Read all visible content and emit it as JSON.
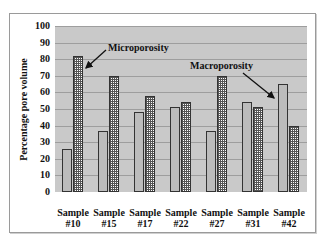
{
  "chart_data": {
    "type": "bar",
    "title": "",
    "xlabel": "",
    "ylabel": "Percentage pore volume",
    "ylim": [
      0,
      100
    ],
    "yticks": [
      0,
      10,
      20,
      30,
      40,
      50,
      60,
      70,
      80,
      90,
      100
    ],
    "grid": true,
    "legend": "none (inline annotations)",
    "categories": [
      "Sample #10",
      "Sample #15",
      "Sample #17",
      "Sample #22",
      "Sample #27",
      "Sample #31",
      "Sample #42"
    ],
    "category_lines": [
      [
        "Sample",
        "#10"
      ],
      [
        "Sample",
        "#15"
      ],
      [
        "Sample",
        "#17"
      ],
      [
        "Sample",
        "#22"
      ],
      [
        "Sample",
        "#27"
      ],
      [
        "Sample",
        "#31"
      ],
      [
        "Sample",
        "#42"
      ]
    ],
    "series": [
      {
        "name": "Macroporosity",
        "pattern": "dotted-light",
        "values": [
          26,
          37,
          48,
          51,
          37,
          54,
          65
        ]
      },
      {
        "name": "Microporosity",
        "pattern": "grid-checkered",
        "values": [
          82,
          70,
          58,
          54,
          70,
          51,
          40
        ]
      }
    ],
    "annotations": [
      {
        "text": "Microporosity",
        "points_to": "Sample #10 microporosity bar"
      },
      {
        "text": "Macroporosity",
        "points_to": "Sample #42 macroporosity bar"
      }
    ]
  },
  "colors": {
    "plot_background": "#c9c9c9",
    "gridline": "#9e9e9e",
    "bar_border": "#333333"
  }
}
